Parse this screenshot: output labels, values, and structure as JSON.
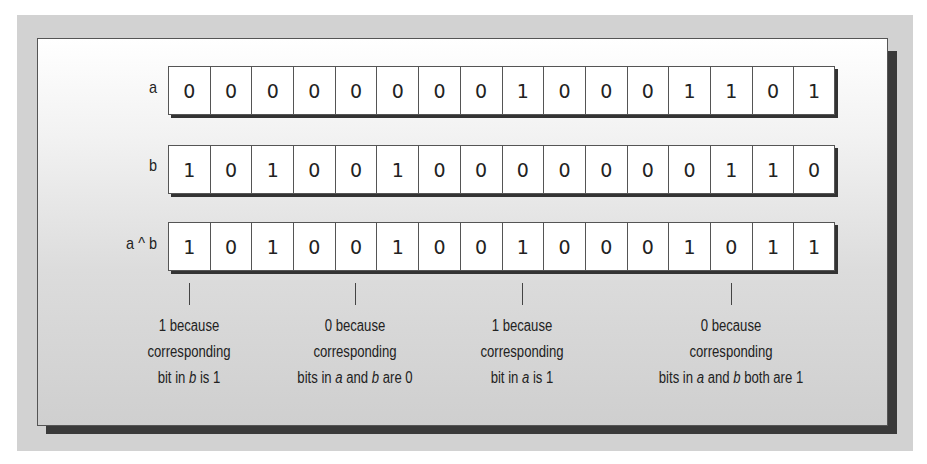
{
  "diagram": {
    "rows": [
      {
        "label": "a",
        "bits": [
          "0",
          "0",
          "0",
          "0",
          "0",
          "0",
          "0",
          "0",
          "1",
          "0",
          "0",
          "0",
          "1",
          "1",
          "0",
          "1"
        ]
      },
      {
        "label": "b",
        "bits": [
          "1",
          "0",
          "1",
          "0",
          "0",
          "1",
          "0",
          "0",
          "0",
          "0",
          "0",
          "0",
          "0",
          "1",
          "1",
          "0"
        ]
      },
      {
        "label": "a ^ b",
        "bits": [
          "1",
          "0",
          "1",
          "0",
          "0",
          "1",
          "0",
          "0",
          "1",
          "0",
          "0",
          "0",
          "1",
          "0",
          "1",
          "1"
        ]
      }
    ],
    "annotations": [
      {
        "bit_index": 0,
        "line1": "1 because",
        "line2": "corresponding",
        "line3_pre": "bit in ",
        "line3_em": "b",
        "line3_post": " is 1"
      },
      {
        "bit_index": 4,
        "line1": "0 because",
        "line2": "corresponding",
        "line3_pre": "bits in ",
        "line3_em": "a",
        "line3_mid": " and ",
        "line3_em2": "b",
        "line3_post": " are 0"
      },
      {
        "bit_index": 8,
        "line1": "1 because",
        "line2": "corresponding",
        "line3_pre": "bit in ",
        "line3_em": "a",
        "line3_post": " is 1"
      },
      {
        "bit_index": 13,
        "line1": "0 because",
        "line2": "corresponding",
        "line3_pre": "bits in ",
        "line3_em": "a",
        "line3_mid": " and ",
        "line3_em2": "b",
        "line3_post": " both are 1"
      }
    ]
  },
  "colors": {
    "background_frame": "#d2d2d2",
    "panel_shadow": "#3a3a3a",
    "cell_fill": "#ffffff",
    "cell_border": "#555555",
    "text": "#222222"
  }
}
